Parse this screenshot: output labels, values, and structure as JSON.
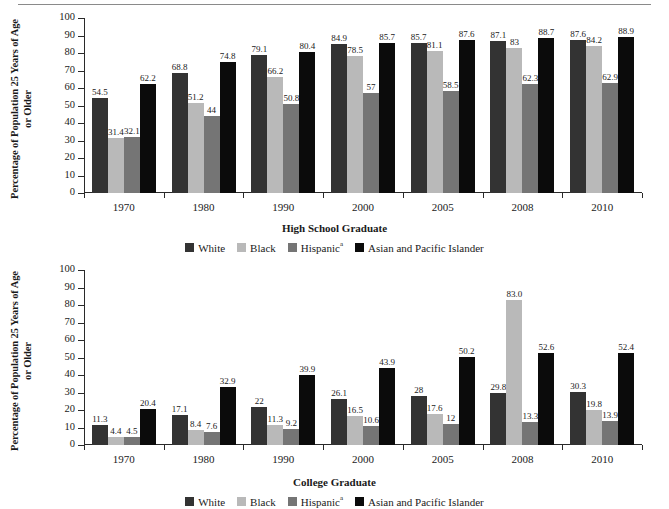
{
  "page": {
    "rule": "horizontal-rule"
  },
  "series_colors": {
    "white": "#333333",
    "black": "#b9b9b9",
    "hispanic": "#757575",
    "asian": "#0b0b0b"
  },
  "legend": {
    "items": [
      {
        "label": "White",
        "sup": "",
        "color_key": "white"
      },
      {
        "label": "Black",
        "sup": "",
        "color_key": "black"
      },
      {
        "label": "Hispanic",
        "sup": "a",
        "color_key": "hispanic"
      },
      {
        "label": "Asian and Pacific Islander",
        "sup": "",
        "color_key": "asian"
      }
    ]
  },
  "ylabel_text": "Percentage of Population 25 Years of Age or Older",
  "yticks": [
    "0",
    "10",
    "20",
    "30",
    "40",
    "50",
    "60",
    "70",
    "80",
    "90",
    "100"
  ],
  "chart_data": [
    {
      "id": "high-school-graduate",
      "type": "bar",
      "title": "",
      "xlabel": "High School Graduate",
      "ylabel": "Percentage of Population 25 Years of Age or Older",
      "ylim": [
        0,
        100
      ],
      "ytick_step": 10,
      "grid": false,
      "legend_position": "bottom-center",
      "categories": [
        "1970",
        "1980",
        "1990",
        "2000",
        "2005",
        "2008",
        "2010"
      ],
      "series": [
        {
          "name": "White",
          "values": [
            54.5,
            68.8,
            79.1,
            84.9,
            85.7,
            87.1,
            87.6
          ],
          "labels": [
            "54.5",
            "68.8",
            "79.1",
            "84.9",
            "85.7",
            "87.1",
            "87.6"
          ]
        },
        {
          "name": "Black",
          "values": [
            31.4,
            51.2,
            66.2,
            78.5,
            81.1,
            83,
            84.2
          ],
          "labels": [
            "31.4",
            "51.2",
            "66.2",
            "78.5",
            "81.1",
            "83",
            "84.2"
          ]
        },
        {
          "name": "Hispanic",
          "values": [
            32.1,
            44,
            50.8,
            57,
            58.5,
            62.3,
            62.9
          ],
          "labels": [
            "32.1",
            "44",
            "50.8",
            "57",
            "58.5",
            "62.3",
            "62.9"
          ]
        },
        {
          "name": "Asian and Pacific Islander",
          "values": [
            62.2,
            74.8,
            80.4,
            85.7,
            87.6,
            88.7,
            88.9
          ],
          "labels": [
            "62.2",
            "74.8",
            "80.4",
            "85.7",
            "87.6",
            "88.7",
            "88.9"
          ]
        }
      ]
    },
    {
      "id": "college-graduate",
      "type": "bar",
      "title": "",
      "xlabel": "College Graduate",
      "ylabel": "Percentage of Population 25 Years of Age or Older",
      "ylim": [
        0,
        100
      ],
      "ytick_step": 10,
      "grid": false,
      "legend_position": "bottom-center",
      "categories": [
        "1970",
        "1980",
        "1990",
        "2000",
        "2005",
        "2008",
        "2010"
      ],
      "series": [
        {
          "name": "White",
          "values": [
            11.3,
            17.1,
            22,
            26.1,
            28,
            29.8,
            30.3
          ],
          "labels": [
            "11.3",
            "17.1",
            "22",
            "26.1",
            "28",
            "29.8",
            "30.3"
          ]
        },
        {
          "name": "Black",
          "values": [
            4.4,
            8.4,
            11.3,
            16.5,
            17.6,
            83.0,
            19.8
          ],
          "labels": [
            "4.4",
            "8.4",
            "11.3",
            "16.5",
            "17.6",
            "83.0",
            "19.8"
          ]
        },
        {
          "name": "Hispanic",
          "values": [
            4.5,
            7.6,
            9.2,
            10.6,
            12,
            13.3,
            13.9
          ],
          "labels": [
            "4.5",
            "7.6",
            "9.2",
            "10.6",
            "12",
            "13.3",
            "13.9"
          ]
        },
        {
          "name": "Asian and Pacific Islander",
          "values": [
            20.4,
            32.9,
            39.9,
            43.9,
            50.2,
            52.6,
            52.4
          ],
          "labels": [
            "20.4",
            "32.9",
            "39.9",
            "43.9",
            "50.2",
            "52.6",
            "52.4"
          ]
        }
      ]
    }
  ]
}
